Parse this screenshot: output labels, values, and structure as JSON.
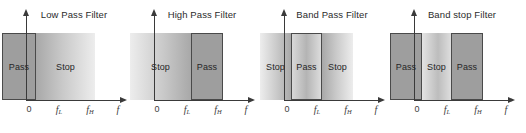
{
  "figure": {
    "axis": {
      "x_ticks": [
        {
          "id": "zero",
          "main": "0",
          "sub": ""
        },
        {
          "id": "f-low",
          "main": "f",
          "sub": "L"
        },
        {
          "id": "f-high",
          "main": "f",
          "sub": "H"
        },
        {
          "id": "f-var",
          "main": "f",
          "sub": ""
        }
      ],
      "x_axis_name": "frequency-axis",
      "y_axis_name": "gain-axis"
    },
    "colors": {
      "pass_fill": "#9e9e9e",
      "band_border": "#4a4a4a",
      "axis": "#3a3a3a",
      "text": "#262626",
      "background": "#ffffff"
    },
    "panels": [
      {
        "id": "low-pass-filter",
        "title": "Low Pass Filter",
        "bands": [
          {
            "label": "Pass",
            "style": "fill-solid",
            "left": 2,
            "width": 34,
            "height": 67
          },
          {
            "label": "Stop",
            "style": "fill-fade-right",
            "left": 36,
            "width": 59,
            "height": 67
          }
        ]
      },
      {
        "id": "high-pass-filter",
        "title": "High Pass Filter",
        "bands": [
          {
            "label": "Stop",
            "style": "fill-fade-left",
            "left": 2,
            "width": 61,
            "height": 67
          },
          {
            "label": "Pass",
            "style": "fill-solid",
            "left": 63,
            "width": 32,
            "height": 67
          }
        ]
      },
      {
        "id": "band-pass-filter",
        "title": "Band Pass Filter",
        "bands": [
          {
            "label": "Stop",
            "style": "fill-fade-left",
            "left": 2,
            "width": 31,
            "height": 67
          },
          {
            "label": "Stop",
            "style": "fill-fade-right",
            "left": 64,
            "width": 31,
            "height": 67
          },
          {
            "label": "Pass",
            "style": "fill-fade-mid",
            "left": 33,
            "width": 31,
            "height": 67,
            "bordered": true
          }
        ]
      },
      {
        "id": "band-stop-filter",
        "title": "Band stop Filter",
        "bands": [
          {
            "label": "Stop",
            "style": "fill-fade-bs",
            "left": 33,
            "width": 31,
            "height": 67
          },
          {
            "label": "Pass",
            "style": "fill-solid",
            "left": 2,
            "width": 32,
            "height": 67
          },
          {
            "label": "Pass",
            "style": "fill-solid",
            "left": 63,
            "width": 32,
            "height": 67
          }
        ]
      }
    ]
  }
}
